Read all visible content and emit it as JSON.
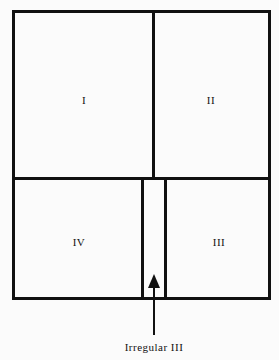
{
  "diagram": {
    "type": "quadrant-plan",
    "regions": [
      {
        "id": "I",
        "label": "I"
      },
      {
        "id": "II",
        "label": "II"
      },
      {
        "id": "III",
        "label": "III"
      },
      {
        "id": "IV",
        "label": "IV"
      }
    ],
    "annotation": {
      "label": "Irregular III",
      "points_to": "narrow strip between IV and III"
    },
    "line_color": "#111111",
    "background": "#fbfbfb"
  }
}
